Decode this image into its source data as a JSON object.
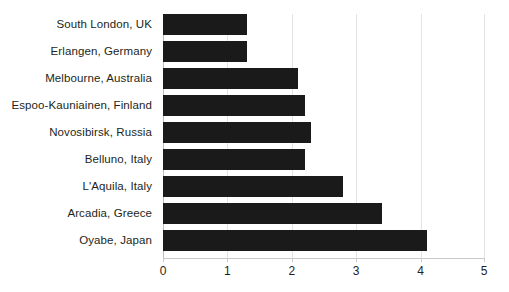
{
  "chart_data": {
    "type": "bar",
    "orientation": "horizontal",
    "title": "",
    "subtitle": "",
    "xlabel": "",
    "ylabel": "",
    "categories": [
      "South London, UK",
      "Erlangen, Germany",
      "Melbourne, Australia",
      "Espoo-Kauniainen, Finland",
      "Novosibirsk, Russia",
      "Belluno, Italy",
      "L'Aquila, Italy",
      "Arcadia, Greece",
      "Oyabe, Japan"
    ],
    "values": [
      1.3,
      1.3,
      2.1,
      2.2,
      2.3,
      2.2,
      2.8,
      3.4,
      4.1
    ],
    "xlim": [
      0,
      5
    ],
    "xticks": [
      0,
      1,
      2,
      3,
      4,
      5
    ],
    "xtick_labels": [
      "0",
      "1",
      "2",
      "3",
      "4",
      "5"
    ],
    "grid": true,
    "grid_axis": "x",
    "legend": false,
    "legend_position": "none",
    "bar_color": "#1a1a1a",
    "gridline_color": "#e3e3e3",
    "axis_color": "#c9c9c9",
    "text_color": "#231f20",
    "background_color": "#ffffff"
  }
}
